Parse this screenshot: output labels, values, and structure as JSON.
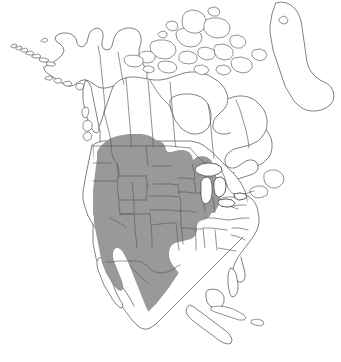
{
  "figure": {
    "kind": "range-map",
    "background_color": "#ffffff",
    "outline_color": "#4a4a4a",
    "border_color": "#5a5a5a",
    "range_fill_color": "#999999",
    "width_px": 341,
    "height_px": 362,
    "caption": ""
  },
  "legend": {
    "visible": false,
    "entries": [
      {
        "label": "Range",
        "color": "#999999"
      },
      {
        "label": "Outside range",
        "color": "#ffffff"
      }
    ]
  },
  "regions": {
    "landmasses": [
      "Alaska",
      "Canada",
      "Canadian Arctic Archipelago",
      "Greenland (western coast)",
      "Contiguous United States",
      "Mexico",
      "Baja California Peninsula",
      "Central America",
      "Cuba"
    ],
    "water_features": [
      "Hudson Bay",
      "Great Lakes",
      "Gulf of Mexico",
      "Gulf of California"
    ]
  },
  "range": {
    "description": "Continuous shaded range covering the western and central United States, the southern Canadian prairie provinces, and tapering southward through Mexico.",
    "included_areas": [
      "Southern British Columbia interior",
      "Alberta",
      "Saskatchewan",
      "Southern Manitoba",
      "Washington interior",
      "Oregon interior",
      "Idaho",
      "Montana",
      "Wyoming",
      "North Dakota",
      "South Dakota",
      "Nebraska",
      "Minnesota",
      "Iowa",
      "Wisconsin",
      "Michigan",
      "Illinois",
      "Indiana",
      "Ohio",
      "Missouri",
      "Kansas",
      "Colorado",
      "Utah",
      "Nevada",
      "California",
      "Arizona",
      "New Mexico",
      "Oklahoma",
      "Western Texas",
      "Baja California",
      "Northern and central Mexico"
    ],
    "excluded_areas": [
      "Alaska",
      "Northern Canada",
      "Arctic Archipelago",
      "Greenland",
      "Pacific Northwest coast",
      "Eastern United States",
      "Southeastern United States",
      "Florida",
      "Gulf coastal plain",
      "Yucatan Peninsula",
      "Central America",
      "Cuba"
    ]
  }
}
